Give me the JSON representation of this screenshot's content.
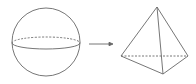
{
  "diagram": {
    "colors": {
      "stroke": "#666666",
      "background": "#ffffff"
    },
    "sphere": {
      "cx": 46,
      "cy": 42,
      "r": 34,
      "equator_rx": 34,
      "equator_ry": 6
    },
    "arrow": {
      "x1": 89,
      "y1": 44,
      "x2": 113,
      "y2": 44
    },
    "pyramid": {
      "apex": [
        157,
        7
      ],
      "left": [
        121,
        56
      ],
      "right": [
        188,
        56
      ],
      "front": [
        163,
        74
      ]
    }
  }
}
